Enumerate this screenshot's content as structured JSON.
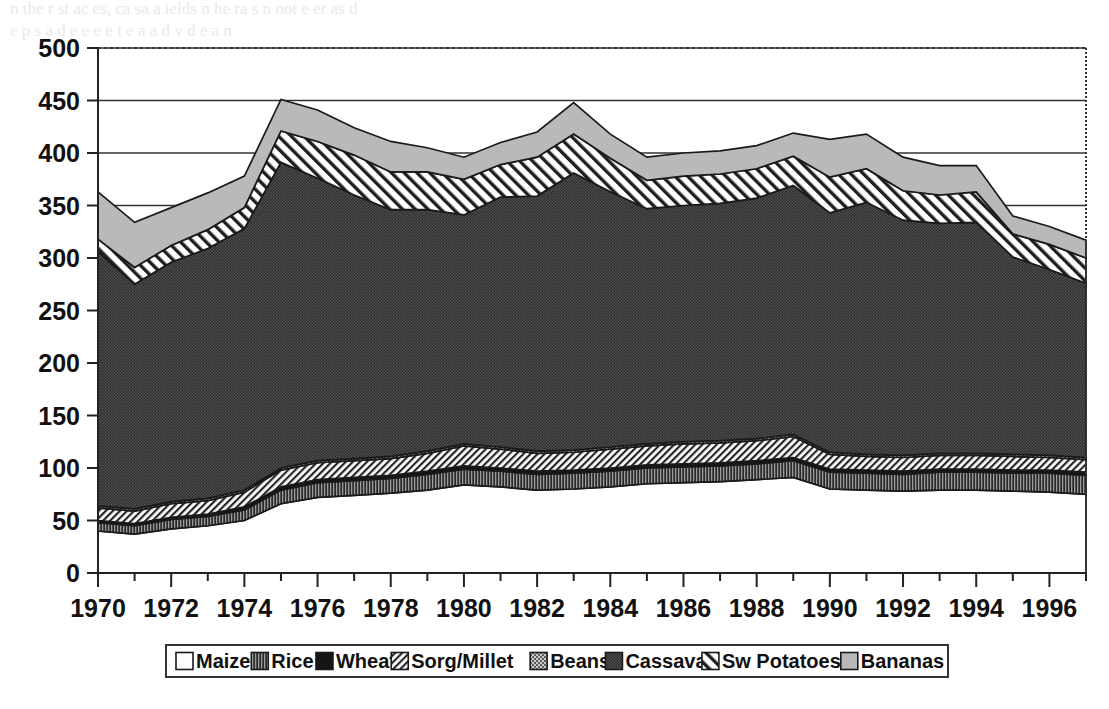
{
  "chart_data": {
    "type": "area",
    "stacked": true,
    "title": "",
    "subtitle": "",
    "xlabel": "",
    "ylabel": "",
    "xlim": [
      1970,
      1997
    ],
    "ylim": [
      0,
      500
    ],
    "y_ticks": [
      0,
      50,
      100,
      150,
      200,
      250,
      300,
      350,
      400,
      450,
      500
    ],
    "x_ticks": [
      1970,
      1971,
      1972,
      1973,
      1974,
      1975,
      1976,
      1977,
      1978,
      1979,
      1980,
      1981,
      1982,
      1983,
      1984,
      1985,
      1986,
      1987,
      1988,
      1989,
      1990,
      1991,
      1992,
      1993,
      1994,
      1995,
      1996,
      1997
    ],
    "x_tick_labels": [
      "1970",
      "",
      "1972",
      "",
      "1974",
      "",
      "1976",
      "",
      "1978",
      "",
      "1980",
      "",
      "1982",
      "",
      "1984",
      "",
      "1986",
      "",
      "1988",
      "",
      "1990",
      "",
      "1992",
      "",
      "1994",
      "",
      "1996",
      ""
    ],
    "grid": "horizontal-major",
    "legend_position": "bottom",
    "x": [
      1970,
      1971,
      1972,
      1973,
      1974,
      1975,
      1976,
      1977,
      1978,
      1979,
      1980,
      1981,
      1982,
      1983,
      1984,
      1985,
      1986,
      1987,
      1988,
      1989,
      1990,
      1991,
      1992,
      1993,
      1994,
      1995,
      1996,
      1997
    ],
    "series": [
      {
        "name": "Maize",
        "fill": "#ffffff",
        "pattern": "solid-white",
        "values": [
          40,
          37,
          42,
          45,
          50,
          66,
          72,
          74,
          76,
          79,
          84,
          82,
          79,
          80,
          82,
          85,
          86,
          87,
          89,
          91,
          80,
          79,
          78,
          79,
          79,
          78,
          77,
          75
        ]
      },
      {
        "name": "Rice",
        "fill": "#5a5a5a",
        "pattern": "vertical-lines",
        "values": [
          8,
          8,
          9,
          9,
          10,
          13,
          14,
          14,
          14,
          15,
          15,
          15,
          15,
          15,
          15,
          15,
          15,
          15,
          15,
          16,
          16,
          16,
          16,
          17,
          17,
          17,
          18,
          18
        ]
      },
      {
        "name": "Wheat",
        "fill": "#161616",
        "pattern": "solid-black",
        "values": [
          2,
          2,
          2,
          2,
          3,
          3,
          3,
          3,
          3,
          3,
          3,
          3,
          3,
          3,
          3,
          3,
          3,
          3,
          3,
          3,
          3,
          3,
          3,
          3,
          3,
          3,
          3,
          3
        ]
      },
      {
        "name": "Sorg/Millet",
        "fill": "#ffffff",
        "pattern": "diagonal-fine",
        "values": [
          12,
          12,
          13,
          13,
          14,
          16,
          16,
          16,
          16,
          17,
          19,
          18,
          17,
          17,
          18,
          18,
          19,
          19,
          19,
          20,
          14,
          13,
          13,
          13,
          13,
          13,
          12,
          12
        ]
      },
      {
        "name": "Beans",
        "fill": "#9a9a9a",
        "pattern": "stipple-light",
        "values": [
          2,
          2,
          2,
          2,
          2,
          2,
          2,
          2,
          2,
          2,
          2,
          2,
          2,
          2,
          2,
          2,
          2,
          2,
          2,
          2,
          2,
          2,
          2,
          2,
          2,
          2,
          2,
          2
        ]
      },
      {
        "name": "Cassava",
        "fill": "#3c3c3c",
        "pattern": "stipple-dark",
        "values": [
          242,
          214,
          228,
          238,
          249,
          291,
          269,
          251,
          235,
          230,
          218,
          238,
          243,
          264,
          243,
          224,
          225,
          226,
          229,
          237,
          228,
          240,
          224,
          219,
          220,
          188,
          177,
          166
        ]
      },
      {
        "name": "Sw Potatoes",
        "fill": "#ffffff",
        "pattern": "diagonal-coarse",
        "values": [
          12,
          16,
          16,
          18,
          20,
          30,
          35,
          38,
          36,
          36,
          34,
          31,
          37,
          37,
          32,
          27,
          28,
          28,
          28,
          28,
          34,
          32,
          28,
          27,
          29,
          22,
          24,
          24
        ]
      },
      {
        "name": "Bananas",
        "fill": "#bdbdbd",
        "pattern": "solid-lightgray",
        "values": [
          45,
          43,
          36,
          35,
          30,
          30,
          30,
          26,
          29,
          23,
          21,
          21,
          24,
          30,
          23,
          22,
          22,
          22,
          22,
          22,
          36,
          33,
          32,
          28,
          25,
          17,
          17,
          17
        ]
      }
    ],
    "totals": [
      363,
      334,
      348,
      362,
      378,
      451,
      441,
      424,
      411,
      405,
      396,
      410,
      420,
      448,
      418,
      396,
      400,
      402,
      407,
      419,
      413,
      418,
      396,
      388,
      388,
      340,
      330,
      317
    ]
  },
  "legend": {
    "items": [
      {
        "label": "Maize",
        "swatch": "swatch-maize"
      },
      {
        "label": "Rice",
        "swatch": "swatch-rice"
      },
      {
        "label": "Wheat",
        "swatch": "swatch-wheat"
      },
      {
        "label": "Sorg/Millet",
        "swatch": "swatch-sorg-millet"
      },
      {
        "label": "Beans",
        "swatch": "swatch-beans"
      },
      {
        "label": "Cassava",
        "swatch": "swatch-cassava"
      },
      {
        "label": "Sw Potatoes",
        "swatch": "swatch-sw-potatoes"
      },
      {
        "label": "Bananas",
        "swatch": "swatch-bananas"
      }
    ]
  },
  "colors": {
    "axis": "#222222",
    "grid": "#333333",
    "plot_background": "#ffffff",
    "page_background": "#ffffff"
  },
  "background_bleed": {
    "top_line_1": "n the    r   st   ac  es, ca sa a  ields  n   he  ra   s  n  not  e    er  as d",
    "top_line_2": "e   p     s a d   e e     e  e  t   e  a   a  d      v  d      e    a   n",
    "mid_line_1": "f    e  e  ons se   de   ti  s   1  85     7   e     pe  en",
    "mid_line_2": "e       i   e       o  n d",
    "mid_line_3": "e  s a      e ss     o  e  e    e  a   tt   ed",
    "lower_line_1": "i   e     l      r          n          o    l         e"
  }
}
